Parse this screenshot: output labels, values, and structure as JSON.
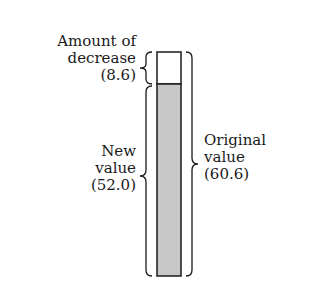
{
  "diagram": {
    "decrease": {
      "label_line1": "Amount of",
      "label_line2": "decrease",
      "value_text": "(8.6)",
      "value": 8.6
    },
    "new_value": {
      "label_line1": "New",
      "label_line2": "value",
      "value_text": "(52.0)",
      "value": 52.0
    },
    "original_value": {
      "label_line1": "Original",
      "label_line2": "value",
      "value_text": "(60.6)",
      "value": 60.6
    },
    "colors": {
      "bar_fill": "#c8c8c8",
      "bar_empty": "#ffffff",
      "stroke": "#1a1a1a"
    }
  }
}
